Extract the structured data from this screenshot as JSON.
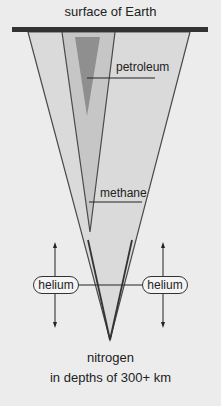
{
  "diagram": {
    "title": "surface of Earth",
    "labels": {
      "petroleum": "petroleum",
      "methane": "methane",
      "helium_left": "helium",
      "helium_right": "helium",
      "nitrogen": "nitrogen",
      "depth": "in  depths of 300+ km"
    },
    "colors": {
      "background": "#ececec",
      "surface_bar": "#333333",
      "outer_fill": "#d9d9d9",
      "middle_fill": "#c4c4c4",
      "inner_fill": "#8e8e8e",
      "outline": "#555555"
    }
  }
}
